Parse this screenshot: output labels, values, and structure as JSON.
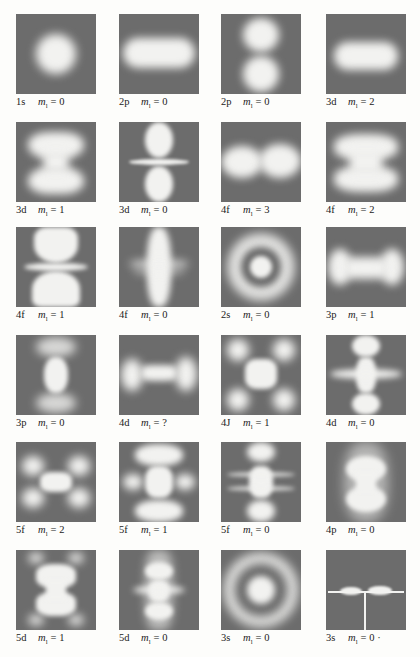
{
  "figure": {
    "cells": [
      {
        "orbital": "1s",
        "m_label": "m",
        "m_sub": "l",
        "eq": "= 0"
      },
      {
        "orbital": "2p",
        "m_label": "m",
        "m_sub": "l",
        "eq": "= 0"
      },
      {
        "orbital": "2p",
        "m_label": "m",
        "m_sub": "l",
        "eq": "= 0"
      },
      {
        "orbital": "3d",
        "m_label": "m",
        "m_sub": "l",
        "eq": "= 2"
      },
      {
        "orbital": "3d",
        "m_label": "m",
        "m_sub": "l",
        "eq": "= 1"
      },
      {
        "orbital": "3d",
        "m_label": "m",
        "m_sub": "l",
        "eq": "= 0"
      },
      {
        "orbital": "4f",
        "m_label": "m",
        "m_sub": "l",
        "eq": "= 3"
      },
      {
        "orbital": "4f",
        "m_label": "m",
        "m_sub": "l",
        "eq": "= 2"
      },
      {
        "orbital": "4f",
        "m_label": "m",
        "m_sub": "l",
        "eq": "= 1"
      },
      {
        "orbital": "4f",
        "m_label": "m",
        "m_sub": "l",
        "eq": "= 0"
      },
      {
        "orbital": "2s",
        "m_label": "m",
        "m_sub": "l",
        "eq": "= 0"
      },
      {
        "orbital": "3p",
        "m_label": "m",
        "m_sub": "l",
        "eq": "= 1"
      },
      {
        "orbital": "3p",
        "m_label": "m",
        "m_sub": "l",
        "eq": "= 0"
      },
      {
        "orbital": "4d",
        "m_label": "m",
        "m_sub": "l",
        "eq": "= ?"
      },
      {
        "orbital": "4J",
        "m_label": "m",
        "m_sub": "l",
        "eq": "= 1"
      },
      {
        "orbital": "4d",
        "m_label": "m",
        "m_sub": "l",
        "eq": "= 0"
      },
      {
        "orbital": "5f",
        "m_label": "m",
        "m_sub": "l",
        "eq": "= 2"
      },
      {
        "orbital": "5f",
        "m_label": "m",
        "m_sub": "l",
        "eq": "= 1"
      },
      {
        "orbital": "5f",
        "m_label": "m",
        "m_sub": "l",
        "eq": "= 0"
      },
      {
        "orbital": "4p",
        "m_label": "m",
        "m_sub": "l",
        "eq": "= 0"
      },
      {
        "orbital": "5d",
        "m_label": "m",
        "m_sub": "l",
        "eq": "= 1"
      },
      {
        "orbital": "5d",
        "m_label": "m",
        "m_sub": "l",
        "eq": "= 0"
      },
      {
        "orbital": "3s",
        "m_label": "m",
        "m_sub": "l",
        "eq": "= 0"
      },
      {
        "orbital": "3s",
        "m_label": "m",
        "m_sub": "l",
        "eq": "= 0 ·"
      }
    ]
  }
}
